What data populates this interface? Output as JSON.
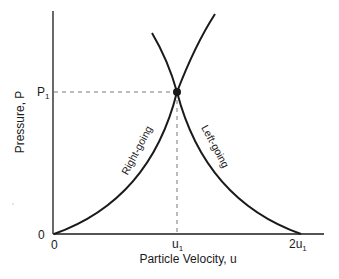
{
  "diagram": {
    "type": "pressure-particle-velocity (P-u) diagram",
    "y_axis": {
      "label": "Pressure, P",
      "ticks": [
        "0",
        "P1"
      ]
    },
    "x_axis": {
      "label": "Particle Velocity, u",
      "ticks": [
        "0",
        "u1",
        "2u1"
      ]
    },
    "curves": [
      {
        "name": "Right-going",
        "label": "Right-going",
        "from": "(0,0)",
        "through": "(u1,P1)"
      },
      {
        "name": "Left-going",
        "label": "Left-going",
        "from": "(2u1,0)",
        "through": "(u1,P1)"
      }
    ],
    "intersection": {
      "u": "u1",
      "P": "P1"
    },
    "colors": {
      "ink": "#1a1a1a",
      "dashed": "#555555"
    }
  },
  "labels": {
    "y_axis": "Pressure, P",
    "x_axis": "Particle Velocity, u",
    "y_tick_0": "0",
    "y_tick_p1_main": "P",
    "y_tick_p1_sub": "1",
    "x_tick_0": "0",
    "x_tick_u1_main": "u",
    "x_tick_u1_sub": "1",
    "x_tick_2u1_main": "2u",
    "x_tick_2u1_sub": "1",
    "right_going": "Right-going",
    "left_going": "Left-going"
  }
}
